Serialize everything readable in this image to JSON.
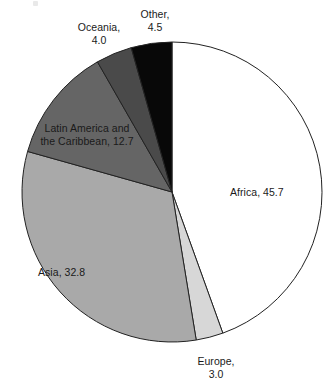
{
  "chart_data": {
    "type": "pie",
    "title": "",
    "subtitle": "",
    "xlabel": "",
    "ylabel": "",
    "legend_position": "none",
    "grid": false,
    "units": "percent",
    "start_angle_deg": 0,
    "direction": "clockwise",
    "categories": [
      "Africa",
      "Europe",
      "Asia",
      "Latin America and the Caribbean",
      "Oceania",
      "Other"
    ],
    "values": [
      45.7,
      3.0,
      32.8,
      12.7,
      4.0,
      4.5
    ],
    "slices": [
      {
        "name": "Africa",
        "value": 45.7,
        "value_text": "45.7",
        "label": "Africa, 45.7",
        "color": "#ffffff",
        "label_placement": "inside"
      },
      {
        "name": "Europe",
        "value": 3.0,
        "value_text": "3.0",
        "label": "Europe,\n3.0",
        "color": "#d7d7d7",
        "label_placement": "outside"
      },
      {
        "name": "Asia",
        "value": 32.8,
        "value_text": "32.8",
        "label": "Asia, 32.8",
        "color": "#a9a9a9",
        "label_placement": "inside"
      },
      {
        "name": "Latin America and the Caribbean",
        "value": 12.7,
        "value_text": "12.7",
        "label": "Latin America and\nthe Caribbean, 12.7",
        "color": "#656565",
        "label_placement": "inside"
      },
      {
        "name": "Oceania",
        "value": 4.0,
        "value_text": "4.0",
        "label": "Oceania,\n4.0",
        "color": "#4a4a4a",
        "label_placement": "outside"
      },
      {
        "name": "Other",
        "value": 4.5,
        "value_text": "4.5",
        "label": "Other,\n4.5",
        "color": "#080808",
        "label_placement": "outside"
      }
    ],
    "geometry": {
      "center_x": 172,
      "center_y": 192,
      "radius": 150
    },
    "outline_color": "#222222"
  }
}
